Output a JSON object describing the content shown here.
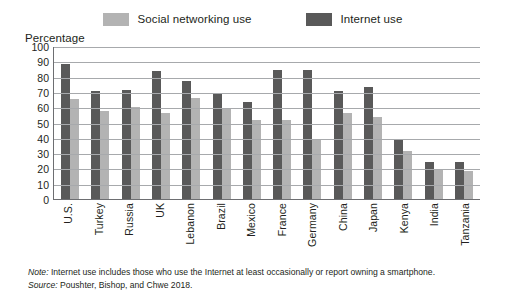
{
  "legend": {
    "items": [
      {
        "label": "Social networking use",
        "color": "#b3b3b3"
      },
      {
        "label": "Internet use",
        "color": "#595959"
      }
    ]
  },
  "axis": {
    "ylabel": "Percentage",
    "yticks": [
      "100",
      "90",
      "80",
      "70",
      "60",
      "50",
      "40",
      "30",
      "20",
      "10",
      "0"
    ]
  },
  "footnotes": {
    "note_prefix": "Note:",
    "note_text": " Internet use includes those who use the Internet at least occasionally or report owning a smartphone.",
    "source_prefix": "Source:",
    "source_text": " Poushter, Bishop, and Chwe 2018."
  },
  "chart_data": {
    "type": "bar",
    "title": "",
    "xlabel": "",
    "ylabel": "Percentage",
    "ylim": [
      0,
      100
    ],
    "ytick_step": 10,
    "grid": true,
    "legend_position": "top-center",
    "series_order": [
      "Internet use",
      "Social networking use"
    ],
    "categories": [
      "U.S.",
      "Turkey",
      "Russia",
      "UK",
      "Lebanon",
      "Brazil",
      "Mexico",
      "France",
      "Germany",
      "China",
      "Japan",
      "Kenya",
      "India",
      "Tanzania"
    ],
    "series": [
      {
        "name": "Internet use",
        "color": "#595959",
        "values": [
          89,
          71,
          72,
          84,
          78,
          70,
          64,
          85,
          85,
          71,
          74,
          39,
          25,
          25
        ]
      },
      {
        "name": "Social networking use",
        "color": "#b3b3b3",
        "values": [
          66,
          58,
          61,
          57,
          67,
          60,
          52,
          52,
          40,
          57,
          54,
          32,
          20,
          19
        ]
      }
    ]
  }
}
